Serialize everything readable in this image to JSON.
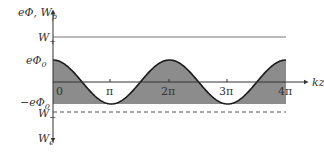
{
  "diagram": {
    "y_axis_label": "eΦ, W",
    "y_axis_label_sub": "p",
    "x_axis_label": "kz",
    "levels": {
      "w_plus": {
        "label": "W",
        "sub": "+"
      },
      "phi0": {
        "label": "eΦ",
        "sub": "0"
      },
      "neg_phi0": {
        "label": "−eΦ",
        "sub": "0"
      },
      "w_minus": {
        "label": "W",
        "sub": "−"
      },
      "w_e": {
        "label": "W",
        "sub": "e"
      }
    },
    "x_ticks": [
      "0",
      "π",
      "2π",
      "3π",
      "4π"
    ],
    "colors": {
      "fill": "#8c8c8c",
      "curve": "#1a1a1a",
      "line": "#555555"
    }
  }
}
